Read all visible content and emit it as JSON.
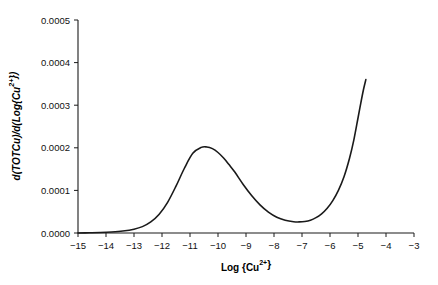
{
  "chart_data": {
    "type": "line",
    "title": "",
    "xlabel": "Log {Cu2+}",
    "xlabel_parts": {
      "base": "Log {Cu",
      "sup": "2+",
      "tail": "}"
    },
    "ylabel": "d(TOTCu)/d(Log{Cu2+})",
    "ylabel_parts": {
      "a": "d(TOTCu)",
      "b": "/d(Log{Cu",
      "sup": "2+",
      "tail": "})"
    },
    "xlim": [
      -15,
      -3
    ],
    "ylim": [
      0.0,
      0.0005
    ],
    "grid": false,
    "legend": null,
    "xticks": [
      -15,
      -14,
      -13,
      -12,
      -11,
      -10,
      -9,
      -8,
      -7,
      -6,
      -5,
      -4,
      -3
    ],
    "xticklabels": [
      "−15",
      "−14",
      "−13",
      "−12",
      "−11",
      "−10",
      "−9",
      "−8",
      "−7",
      "−6",
      "−5",
      "−4",
      "−3"
    ],
    "yticks": [
      0.0,
      0.0001,
      0.0002,
      0.0003,
      0.0004,
      0.0005
    ],
    "yticklabels": [
      "0.0000",
      "0.0001",
      "0.0002",
      "0.0003",
      "0.0004",
      "0.0005"
    ],
    "series": [
      {
        "name": "d(TOTCu)/d(Log{Cu2+})",
        "color": "#1a1a1a",
        "x": [
          -15.0,
          -14.6,
          -14.2,
          -13.8,
          -13.4,
          -13.0,
          -12.7,
          -12.4,
          -12.1,
          -11.8,
          -11.5,
          -11.2,
          -10.9,
          -10.6,
          -10.4,
          -10.2,
          -10.0,
          -9.8,
          -9.6,
          -9.4,
          -9.1,
          -8.8,
          -8.5,
          -8.2,
          -7.9,
          -7.6,
          -7.3,
          -7.1,
          -6.9,
          -6.7,
          -6.5,
          -6.3,
          -6.1,
          -5.9,
          -5.7,
          -5.5,
          -5.3,
          -5.15,
          -5.0,
          -4.9,
          -4.8,
          -4.72
        ],
        "y": [
          0.0,
          5e-07,
          1.2e-06,
          2.5e-06,
          4.8e-06,
          9e-06,
          1.5e-05,
          2.6e-05,
          4.4e-05,
          7.2e-05,
          0.00011,
          0.000152,
          0.000187,
          0.000201,
          0.000202,
          0.000198,
          0.000189,
          0.000176,
          0.00016,
          0.000143,
          0.000114,
          8.8e-05,
          6.6e-05,
          4.9e-05,
          3.7e-05,
          3e-05,
          2.65e-05,
          2.6e-05,
          2.7e-05,
          3e-05,
          3.6e-05,
          4.5e-05,
          5.8e-05,
          7.6e-05,
          0.0001,
          0.000132,
          0.000176,
          0.000218,
          0.00027,
          0.000305,
          0.000338,
          0.00036
        ]
      }
    ],
    "annotations": []
  },
  "axes": {
    "x_axis_name": "x-axis",
    "y_axis_name": "y-axis"
  }
}
